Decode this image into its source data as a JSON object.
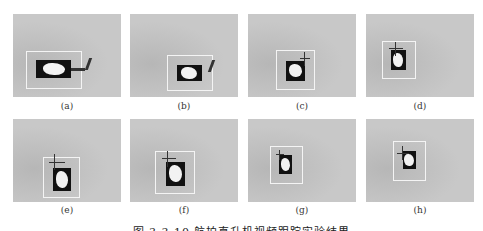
{
  "figure": {
    "caption": "图 3.3.10  航拍直升机视频跟踪实验结果",
    "panels": [
      {
        "label": "(a)"
      },
      {
        "label": "(b)"
      },
      {
        "label": "(c)"
      },
      {
        "label": "(d)"
      },
      {
        "label": "(e)"
      },
      {
        "label": "(f)"
      },
      {
        "label": "(g)"
      },
      {
        "label": "(h)"
      }
    ]
  }
}
